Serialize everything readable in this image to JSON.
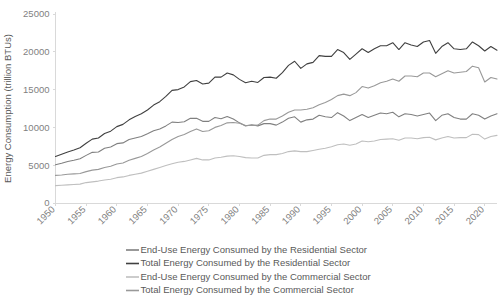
{
  "chart_data": {
    "type": "line",
    "title": "",
    "xlabel": "",
    "ylabel": "Energy Consumption (trillion BTUs)",
    "xlim": [
      1950,
      2022
    ],
    "ylim": [
      0,
      25000
    ],
    "grid": false,
    "legend_position": "bottom",
    "ytick_labels": [
      "0",
      "5000",
      "10000",
      "15000",
      "20000",
      "25000"
    ],
    "ytick_values": [
      0,
      5000,
      10000,
      15000,
      20000,
      25000
    ],
    "xtick_labels": [
      "1950",
      "1955",
      "1960",
      "1965",
      "1970",
      "1975",
      "1980",
      "1985",
      "1990",
      "1995",
      "2000",
      "2005",
      "2010",
      "2015",
      "2020"
    ],
    "xtick_values": [
      1950,
      1955,
      1960,
      1965,
      1970,
      1975,
      1980,
      1985,
      1990,
      1995,
      2000,
      2005,
      2010,
      2015,
      2020
    ],
    "x": [
      1950,
      1951,
      1952,
      1953,
      1954,
      1955,
      1956,
      1957,
      1958,
      1959,
      1960,
      1961,
      1962,
      1963,
      1964,
      1965,
      1966,
      1967,
      1968,
      1969,
      1970,
      1971,
      1972,
      1973,
      1974,
      1975,
      1976,
      1977,
      1978,
      1979,
      1980,
      1981,
      1982,
      1983,
      1984,
      1985,
      1986,
      1987,
      1988,
      1989,
      1990,
      1991,
      1992,
      1993,
      1994,
      1995,
      1996,
      1997,
      1998,
      1999,
      2000,
      2001,
      2002,
      2003,
      2004,
      2005,
      2006,
      2007,
      2008,
      2009,
      2010,
      2011,
      2012,
      2013,
      2014,
      2015,
      2016,
      2017,
      2018,
      2019,
      2020,
      2021,
      2022
    ],
    "series": [
      {
        "name": "End-Use Energy Consumed by the Residential Sector",
        "color": "#808080",
        "values": [
          5050,
          5250,
          5500,
          5650,
          5850,
          6300,
          6700,
          6750,
          7250,
          7400,
          7850,
          7950,
          8400,
          8600,
          8800,
          9150,
          9550,
          9800,
          10200,
          10700,
          10650,
          10750,
          11200,
          11200,
          10800,
          10800,
          11300,
          11150,
          11450,
          11100,
          10600,
          10200,
          10350,
          10200,
          10500,
          10500,
          10300,
          10700,
          11200,
          11400,
          10700,
          11000,
          11100,
          11600,
          11400,
          11300,
          11950,
          11500,
          10900,
          11300,
          11700,
          11300,
          11600,
          11900,
          11800,
          12000,
          11400,
          11800,
          11700,
          11500,
          11700,
          11900,
          10900,
          11600,
          11800,
          11300,
          11100,
          11100,
          11800,
          11600,
          11100,
          11500,
          11800
        ]
      },
      {
        "name": "Total Energy Consumed by the Residential Sector",
        "color": "#404040",
        "values": [
          6150,
          6450,
          6750,
          7000,
          7300,
          7900,
          8450,
          8600,
          9200,
          9500,
          10100,
          10400,
          11000,
          11450,
          11800,
          12300,
          12950,
          13400,
          14100,
          14900,
          15000,
          15350,
          16050,
          16200,
          15750,
          15850,
          16650,
          16650,
          17200,
          16950,
          16350,
          15900,
          16100,
          15950,
          16600,
          16650,
          16500,
          17250,
          18200,
          18750,
          17800,
          18400,
          18600,
          19500,
          19400,
          19400,
          20300,
          19900,
          19000,
          19700,
          20400,
          19900,
          20400,
          20800,
          20800,
          21200,
          20300,
          21200,
          20900,
          20700,
          21300,
          21500,
          19800,
          20700,
          21200,
          20400,
          20300,
          20400,
          21300,
          20800,
          20100,
          20700,
          20200
        ]
      },
      {
        "name": "End-Use Energy Consumed by the Commercial Sector",
        "color": "#bfbfbf",
        "values": [
          2300,
          2350,
          2400,
          2450,
          2500,
          2700,
          2800,
          2900,
          3050,
          3150,
          3350,
          3450,
          3650,
          3800,
          3950,
          4200,
          4450,
          4700,
          4950,
          5200,
          5400,
          5500,
          5700,
          5900,
          5700,
          5700,
          5950,
          6050,
          6200,
          6250,
          6150,
          6000,
          5950,
          5950,
          6300,
          6400,
          6400,
          6550,
          6800,
          6900,
          6800,
          6800,
          6950,
          7100,
          7250,
          7450,
          7700,
          7800,
          7650,
          7800,
          8200,
          8100,
          8200,
          8400,
          8450,
          8500,
          8300,
          8600,
          8600,
          8500,
          8650,
          8700,
          8350,
          8600,
          8800,
          8600,
          8650,
          8650,
          9100,
          9050,
          8450,
          8800,
          8950
        ]
      },
      {
        "name": "Total Energy Consumed by the Commercial Sector",
        "color": "#999999",
        "values": [
          3650,
          3700,
          3800,
          3850,
          3900,
          4150,
          4350,
          4450,
          4700,
          4850,
          5150,
          5300,
          5650,
          5900,
          6150,
          6550,
          7000,
          7400,
          7900,
          8400,
          8800,
          9050,
          9450,
          9800,
          9450,
          9550,
          10000,
          10250,
          10600,
          10650,
          10550,
          10250,
          10250,
          10300,
          10900,
          11100,
          11100,
          11500,
          12000,
          12300,
          12300,
          12400,
          12600,
          13000,
          13300,
          13700,
          14200,
          14400,
          14200,
          14600,
          15400,
          15200,
          15500,
          15900,
          16100,
          16400,
          16100,
          16800,
          16800,
          16700,
          17200,
          17200,
          16700,
          17100,
          17500,
          17200,
          17300,
          17400,
          18100,
          17900,
          16000,
          16600,
          16400
        ]
      }
    ]
  },
  "legend": {
    "items": [
      {
        "label": "End-Use Energy Consumed by the Residential Sector",
        "color": "#808080"
      },
      {
        "label": "Total Energy Consumed by the Residential Sector",
        "color": "#404040"
      },
      {
        "label": "End-Use Energy Consumed by the Commercial Sector",
        "color": "#bfbfbf"
      },
      {
        "label": "Total Energy Consumed by the Commercial Sector",
        "color": "#999999"
      }
    ]
  },
  "axes": {
    "y_title": "Energy Consumption (trillion BTUs)"
  }
}
